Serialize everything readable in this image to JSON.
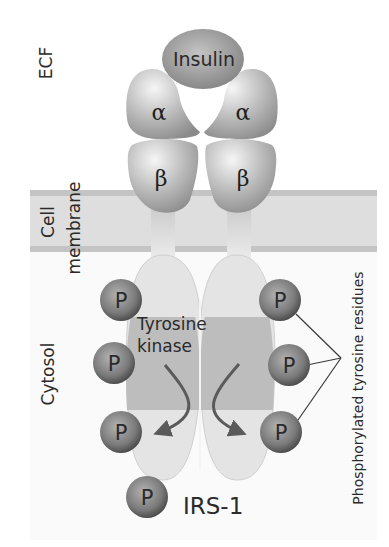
{
  "figure": {
    "type": "diagram",
    "regions": {
      "ecf": "ECF",
      "membrane_line1": "Cell",
      "membrane_line2": "membrane",
      "cytosol": "Cytosol"
    },
    "ligand": "Insulin",
    "subunits": {
      "alpha_left": "α",
      "alpha_right": "α",
      "beta_left": "β",
      "beta_right": "β"
    },
    "kinase_line1": "Tyrosine",
    "kinase_line2": "kinase",
    "phosphate_symbol": "P",
    "phosphates": [
      {
        "id": "left-top",
        "label": "P"
      },
      {
        "id": "left-middle",
        "label": "P"
      },
      {
        "id": "left-bottom",
        "label": "P"
      },
      {
        "id": "right-top",
        "label": "P"
      },
      {
        "id": "right-middle",
        "label": "P"
      },
      {
        "id": "right-bottom",
        "label": "P"
      },
      {
        "id": "irs1",
        "label": "P"
      }
    ],
    "substrate": "IRS-1",
    "callout": "Phosphorylated tyrosine residues",
    "colors": {
      "membrane": "#dedede",
      "membrane_edge": "#c4c4c4",
      "protein_light": "#e2e2e2",
      "kinase_band": "#bdbdbd",
      "sphere_dark": "#5c5c5c",
      "sphere_light": "#a9a9a9",
      "arrow": "#5a5a5a",
      "text": "#2a2a2a"
    }
  }
}
